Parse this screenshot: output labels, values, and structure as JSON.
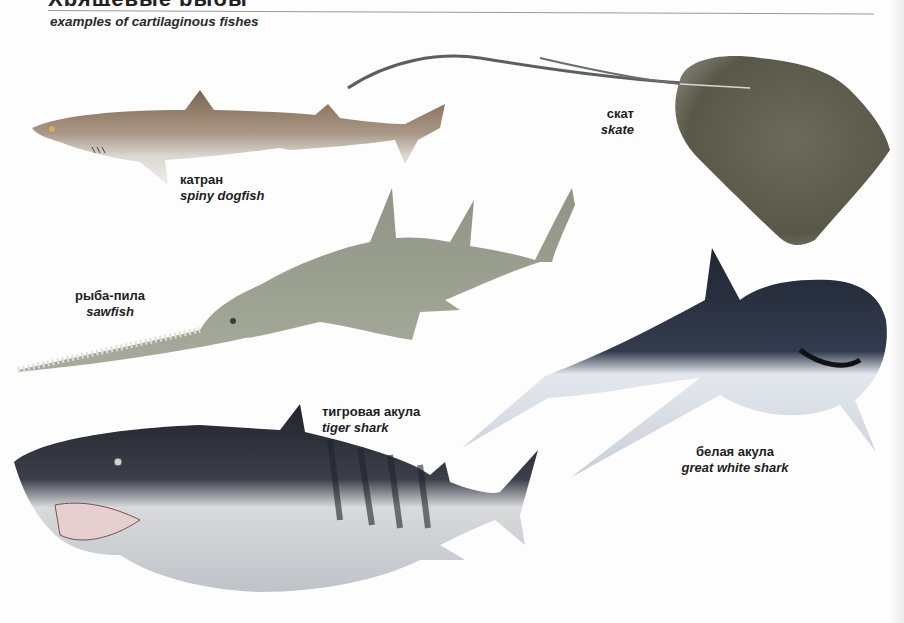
{
  "page": {
    "heading_partial": "Хрящевые рыбы",
    "subtitle": "examples of cartilaginous fishes"
  },
  "fishes": [
    {
      "id": "spiny-dogfish",
      "ru": "катран",
      "en": "spiny dogfish",
      "color": "#8a7560"
    },
    {
      "id": "skate",
      "ru": "скат",
      "en": "skate",
      "color": "#5e5c52"
    },
    {
      "id": "sawfish",
      "ru": "рыба-пила",
      "en": "sawfish",
      "color": "#9a9e8e"
    },
    {
      "id": "tiger-shark",
      "ru": "тигровая акула",
      "en": "tiger shark",
      "color": "#3a3d46"
    },
    {
      "id": "great-white-shark",
      "ru": "белая акула",
      "en": "great white shark",
      "color": "#2a3344"
    }
  ]
}
